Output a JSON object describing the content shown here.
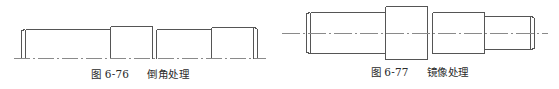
{
  "page": {
    "background_color": "#ffffff",
    "width": 559,
    "height": 89
  },
  "figures": [
    {
      "id": "figure-left",
      "caption_number": "图 6-76",
      "caption_title": "倒角处理",
      "drawing_type": "stepped-shaft-outline",
      "line_color": "#555555",
      "centerline_color": "#777777",
      "description": "阶梯轴轮廓线图，带倒角，底部为点画线中心线"
    },
    {
      "id": "figure-right",
      "caption_number": "图 6-77",
      "caption_title": "镜像处理",
      "drawing_type": "symmetric-stepped-shaft",
      "line_color": "#555555",
      "centerline_color": "#777777",
      "description": "对称阶梯轴视图，水平点画线中心线贯穿全图"
    }
  ]
}
